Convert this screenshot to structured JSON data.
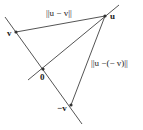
{
  "diagram": {
    "labels": {
      "u": "u",
      "v": "v",
      "zero": "0",
      "neg_v": "−v",
      "norm_u_minus_v": "||u − v||",
      "norm_u_minus_neg_v": "||u −(− v)||"
    },
    "points": {
      "u": [
        105,
        16
      ],
      "v": [
        16,
        32
      ],
      "zero": [
        43,
        69
      ],
      "neg_v": [
        71,
        105
      ]
    },
    "colors": {
      "line": "#555555",
      "point": "#333333",
      "text": "#222222"
    }
  }
}
